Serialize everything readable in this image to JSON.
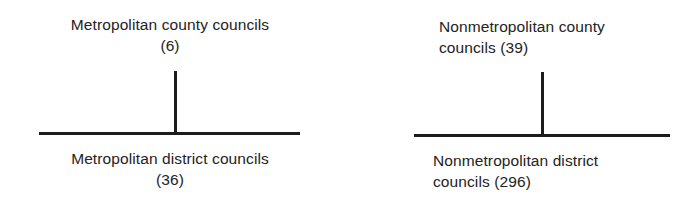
{
  "diagram": {
    "groups": [
      {
        "upper": {
          "name": "Metropolitan county councils",
          "count": "(6)"
        },
        "lower": {
          "name": "Metropolitan district councils",
          "count": "(36)"
        }
      },
      {
        "upper": {
          "line1": "Nonmetropolitan county",
          "line2": "councils (39)"
        },
        "lower": {
          "line1": "Nonmetropolitan district",
          "line2": "councils (296)"
        }
      }
    ]
  }
}
